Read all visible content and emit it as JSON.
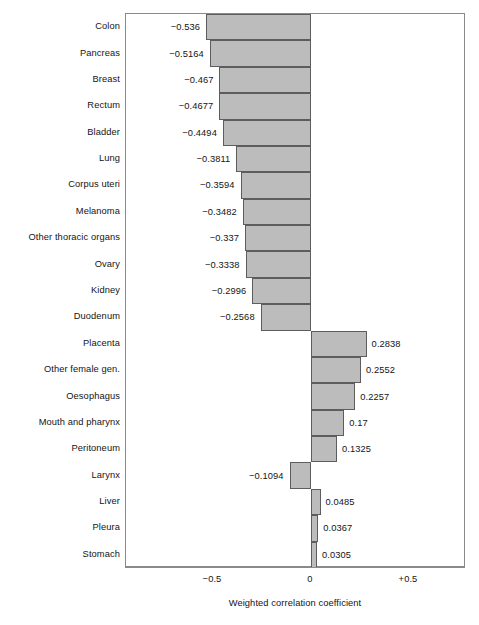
{
  "chart_data": {
    "type": "bar",
    "orientation": "horizontal",
    "title": "",
    "xlabel": "Weighted correlation coefficient",
    "ylabel": "",
    "xlim": [
      -0.6,
      0.6
    ],
    "grid": false,
    "legend": null,
    "xticks": [
      {
        "value": -0.5,
        "label": "−0.5"
      },
      {
        "value": 0,
        "label": "0"
      },
      {
        "value": 0.5,
        "label": "+0.5"
      }
    ],
    "categories": [
      "Colon",
      "Pancreas",
      "Breast",
      "Rectum",
      "Bladder",
      "Lung",
      "Corpus uteri",
      "Melanoma",
      "Other thoracic organs",
      "Ovary",
      "Kidney",
      "Duodenum",
      "Placenta",
      "Other female gen.",
      "Oesophagus",
      "Mouth and pharynx",
      "Peritoneum",
      "Larynx",
      "Liver",
      "Pleura",
      "Stomach"
    ],
    "values": [
      -0.536,
      -0.5164,
      -0.467,
      -0.4677,
      -0.4494,
      -0.3811,
      -0.3594,
      -0.3482,
      -0.337,
      -0.3338,
      -0.2996,
      -0.2568,
      0.2838,
      0.2552,
      0.2257,
      0.17,
      0.1325,
      -0.1094,
      0.0485,
      0.0367,
      0.0305
    ],
    "value_labels": [
      "−0.536",
      "−0.5164",
      "−0.467",
      "−0.4677",
      "−0.4494",
      "−0.3811",
      "−0.3594",
      "−0.3482",
      "−0.337",
      "−0.3338",
      "−0.2996",
      "−0.2568",
      "0.2838",
      "0.2552",
      "0.2257",
      "0.17",
      "0.1325",
      "−0.1094",
      "0.0485",
      "0.0367",
      "0.0305"
    ],
    "colors": {
      "bar_fill": "#bcbcbc",
      "bar_stroke": "#5d5d5d",
      "frame": "#8a8a8a",
      "text": "#141414",
      "background": "#ffffff"
    }
  }
}
